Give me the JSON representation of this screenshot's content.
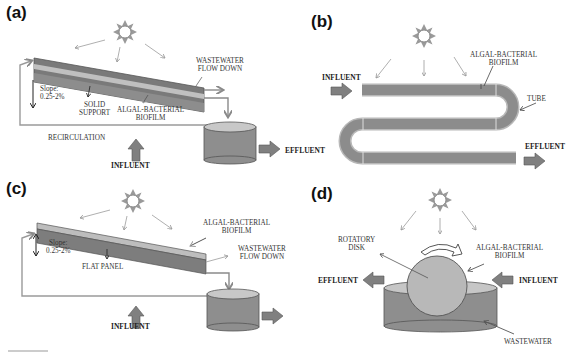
{
  "figure": {
    "panels": [
      {
        "id": "a",
        "label": "(a)",
        "type": "inclined solid support biofilm reactor",
        "labels": {
          "wastewater_flow": "WASTEWATER\nFLOW DOWN",
          "slope": "Slope:\n0.25-2%",
          "solid_support": "SOLID\nSUPPORT",
          "biofilm": "ALGAL-BACTERIAL\nBIOFILM",
          "recirculation": "RECIRCULATION",
          "influent": "INFLUENT",
          "effluent": "EFFLUENT"
        }
      },
      {
        "id": "b",
        "label": "(b)",
        "type": "serpentine tubular biofilm reactor",
        "labels": {
          "biofilm": "ALGAL-BACTERIAL\nBIOFILM",
          "tube": "TUBE",
          "influent": "INFLUENT",
          "effluent": "EFFLUENT"
        }
      },
      {
        "id": "c",
        "label": "(c)",
        "type": "inclined flat panel biofilm reactor",
        "labels": {
          "biofilm": "ALGAL-BACTERIAL\nBIOFILM",
          "wastewater_flow": "WASTEWATER\nFLOW DOWN",
          "slope": "Slope:\n0.25-2%",
          "flat_panel": "FLAT PANEL",
          "influent": "INFLUENT",
          "effluent": "EFFLUENT"
        }
      },
      {
        "id": "d",
        "label": "(d)",
        "type": "rotating disk biofilm reactor",
        "labels": {
          "rotatory_disk": "ROTATORY\nDISK",
          "biofilm": "ALGAL-BACTERIAL\nBIOFILM",
          "effluent": "EFFLUENT",
          "influent": "INFLUENT",
          "wastewater": "WASTEWATER"
        }
      }
    ],
    "colors": {
      "support_dark": "#6f6f6f",
      "support_mid": "#8a8a8a",
      "biofilm_light": "#bdbdbd",
      "tube_gray": "#8c8c8c",
      "tank_gray": "#8e8e8e",
      "disk_gray": "#b8b8b8",
      "arrow_gray": "#9a9a9a",
      "flow_arrow": "#7a7a7a",
      "sun": "#8a8a8a",
      "text": "#333333"
    }
  }
}
